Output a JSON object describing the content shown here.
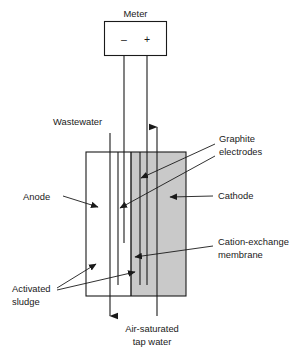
{
  "figure": {
    "colors": {
      "stroke": "#1a1a1a",
      "background": "#ffffff",
      "cathode_chamber_fill": "#c9c9c9",
      "membrane": "#1a1a1a"
    }
  },
  "meter": {
    "label": "Meter",
    "negative_terminal": "–",
    "positive_terminal": "+"
  },
  "labels": {
    "wastewater": "Wastewater",
    "graphite_electrodes_line1": "Graphite",
    "graphite_electrodes_line2": "electrodes",
    "anode": "Anode",
    "cathode": "Cathode",
    "cation_exchange_line1": "Cation-exchange",
    "cation_exchange_line2": "membrane",
    "activated_sludge_line1": "Activated",
    "activated_sludge_line2": "sludge",
    "air_saturated_line1": "Air-saturated",
    "air_saturated_line2": "tap water"
  }
}
